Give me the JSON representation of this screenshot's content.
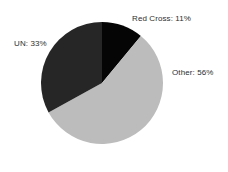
{
  "chart_data": {
    "type": "pie",
    "title": "",
    "categories": [
      "Red Cross",
      "Other",
      "UN"
    ],
    "values": [
      11,
      56,
      33
    ],
    "unit": "%",
    "labels": [
      "Red Cross: 11%",
      "Other: 56%",
      "UN: 33%"
    ],
    "colors": [
      "#050505",
      "#bcbcbc",
      "#262626"
    ],
    "legend": "none",
    "grid": false,
    "start_angle_deg": 0,
    "direction": "clockwise",
    "background": "#ffffff",
    "label_color": "#2e2e2e",
    "slices": [
      {
        "name": "Red Cross",
        "label": "Red Cross: 11%",
        "value": 11,
        "color": "#050505"
      },
      {
        "name": "Other",
        "label": "Other: 56%",
        "value": 56,
        "color": "#bcbcbc"
      },
      {
        "name": "UN",
        "label": "UN: 33%",
        "value": 33,
        "color": "#262626"
      }
    ]
  }
}
